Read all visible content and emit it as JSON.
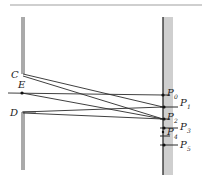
{
  "diagram": {
    "type": "double-slit interference geometry",
    "slits": {
      "upper": {
        "label": "C"
      },
      "middle": {
        "label": "E"
      },
      "lower": {
        "label": "D"
      }
    },
    "screen_points": [
      {
        "label": "P",
        "sub": "0"
      },
      {
        "label": "P",
        "sub": "1"
      },
      {
        "label": "P",
        "sub": "2"
      },
      {
        "label": "P",
        "sub": "3"
      },
      {
        "label": "P",
        "sub": "4"
      },
      {
        "label": "P",
        "sub": "5"
      }
    ],
    "colors": {
      "line": "#2a2a2a",
      "screen_fill": "#c8c8c8",
      "rule": "#9a9a9a"
    }
  }
}
